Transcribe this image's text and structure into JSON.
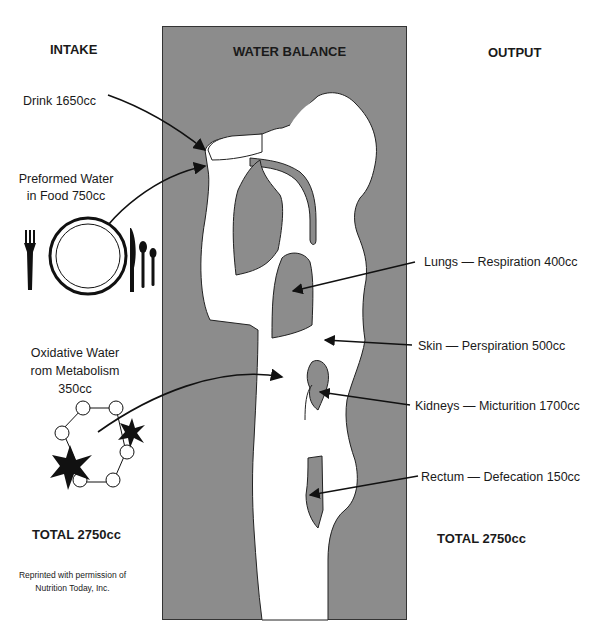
{
  "title": "WATER BALANCE",
  "intake": {
    "heading": "INTAKE",
    "items": [
      {
        "label": "Drink 1650cc"
      },
      {
        "label_line1": "Preformed Water",
        "label_line2": "in Food 750cc"
      },
      {
        "label_line1": "Oxidative Water",
        "label_line2": "rom Metabolism",
        "label_line3": "350cc"
      }
    ],
    "total": "TOTAL 2750cc"
  },
  "output": {
    "heading": "OUTPUT",
    "items": [
      {
        "label": "Lungs — Respiration 400cc"
      },
      {
        "label": "Skin — Perspiration 500cc"
      },
      {
        "label": "Kidneys — Micturition 1700cc"
      },
      {
        "label": "Rectum — Defecation 150cc"
      }
    ],
    "total": "TOTAL 2750cc"
  },
  "credit": {
    "line1": "Reprinted with permission of",
    "line2": "Nutrition Today, Inc."
  },
  "colors": {
    "panel": "#8c8c8c",
    "body": "#ffffff",
    "organ": "#8c8c8c",
    "ink": "#1a1a1a"
  }
}
